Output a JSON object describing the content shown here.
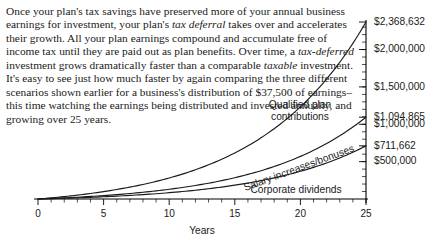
{
  "body_text": {
    "segments": [
      {
        "text": "Once your plan's tax savings have preserved more of your annual business earnings for investment, your plan's ",
        "italic": false
      },
      {
        "text": "tax deferral",
        "italic": true
      },
      {
        "text": " takes over and accelerates their growth. All your plan earnings compound and accumulate free of income tax until they are paid out as plan benefits. Over time, a ",
        "italic": false
      },
      {
        "text": "tax-deferred",
        "italic": true
      },
      {
        "text": " investment grows dramatically faster than a comparable ",
        "italic": false
      },
      {
        "text": "taxable",
        "italic": true
      },
      {
        "text": " investment. It's easy to see just how much faster by again comparing the three different scenarios shown earlier for a business's distribution of $37,500 of earnings–this time watching the earnings being distributed and invested annually, and growing over 25 years.",
        "italic": false
      }
    ]
  },
  "chart_data": {
    "type": "line",
    "title": "",
    "xlabel": "Years",
    "ylabel": "",
    "xlim": [
      0,
      25
    ],
    "ylim": [
      0,
      2368632
    ],
    "grid": false,
    "legend_position": "inline",
    "x_ticks_major": [
      0,
      5,
      10,
      15,
      20,
      25
    ],
    "x_tick_labels": [
      "0",
      "5",
      "10",
      "15",
      "20",
      "25"
    ],
    "x_tick_minor_step": 1,
    "y_axis_side": "right",
    "y_ticks": [
      500000,
      1000000,
      1500000,
      2000000
    ],
    "y_tick_labels": [
      "$500,000",
      "$1,000,000",
      "$1,500,000",
      "$2,000,000"
    ],
    "y_endpoint_labels": [
      {
        "value": 2368632,
        "label": "$2,368,632"
      },
      {
        "value": 1094865,
        "label": "$1,094,865"
      },
      {
        "value": 711662,
        "label": "$711,662"
      }
    ],
    "series": [
      {
        "name": "Qualified plan contributions",
        "label": "Qualified plan contributions",
        "label_lines": [
          "Qualified plan",
          "contributions"
        ],
        "final_value": 2368632,
        "x": [
          0,
          1,
          2,
          3,
          4,
          5,
          6,
          7,
          8,
          9,
          10,
          11,
          12,
          13,
          14,
          15,
          16,
          17,
          18,
          19,
          20,
          21,
          22,
          23,
          24,
          25
        ],
        "values": [
          0,
          40875,
          85428,
          133991,
          186925,
          244623,
          307514,
          376065,
          450786,
          532232,
          621010,
          717783,
          823276,
          938284,
          1063677,
          1200403,
          1349504,
          1512114,
          1689479,
          1882957,
          2094039,
          2324353,
          2575685,
          2849987,
          3149401,
          2368632
        ]
      },
      {
        "name": "Salary increases/bonuses",
        "label": "Salary increases/bonuses",
        "label_lines": [
          "Salary increases/bonuses"
        ],
        "final_value": 1094865,
        "x": [
          0,
          1,
          2,
          3,
          4,
          5,
          6,
          7,
          8,
          9,
          10,
          11,
          12,
          13,
          14,
          15,
          16,
          17,
          18,
          19,
          20,
          21,
          22,
          23,
          24,
          25
        ],
        "values": [
          0,
          24000,
          49400,
          76300,
          104800,
          135000,
          167000,
          200900,
          236900,
          275100,
          315600,
          358600,
          404200,
          452600,
          503900,
          558300,
          616000,
          677200,
          742100,
          810900,
          883800,
          961100,
          1043100,
          1130000,
          1222200,
          1094865
        ]
      },
      {
        "name": "Corporate dividends",
        "label": "Corporate dividends",
        "label_lines": [
          "Corporate dividends"
        ],
        "final_value": 711662,
        "x": [
          0,
          1,
          2,
          3,
          4,
          5,
          6,
          7,
          8,
          9,
          10,
          11,
          12,
          13,
          14,
          15,
          16,
          17,
          18,
          19,
          20,
          21,
          22,
          23,
          24,
          25
        ],
        "values": [
          0,
          16200,
          33300,
          51300,
          70300,
          90400,
          111600,
          134000,
          157600,
          182500,
          208800,
          236500,
          265800,
          296700,
          329400,
          363800,
          400200,
          438600,
          479200,
          522000,
          567300,
          615000,
          665500,
          718700,
          775000,
          711662
        ]
      }
    ]
  }
}
